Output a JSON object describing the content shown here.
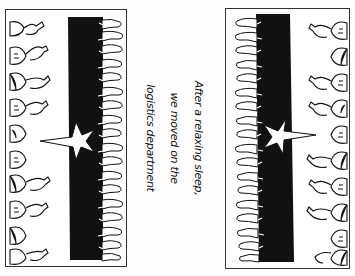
{
  "illustration": {
    "style": "black-and-white hand-drawn comic",
    "colors": {
      "ink": "#111111",
      "paper": "#ffffff",
      "frame": "#333333"
    },
    "panels": [
      {
        "id": "left",
        "description": "crowd of cartoon people lining a black stage with a white star",
        "contents": [
          "crowd-figures",
          "black-stage",
          "white-hands-fringe",
          "star"
        ]
      },
      {
        "id": "right",
        "description": "mirrored scene: crowd of cartoon people facing a black stage with a white star",
        "contents": [
          "crowd-figures",
          "black-stage",
          "white-hands-fringe",
          "star"
        ]
      }
    ]
  },
  "caption": {
    "lines": [
      "After a relaxing sleep,",
      "we moved on the",
      "logistics department"
    ],
    "orientation": "rotated 90deg clockwise"
  }
}
